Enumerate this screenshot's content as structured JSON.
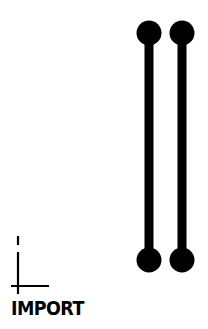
{
  "import_button": {
    "label": "IMPORT",
    "icon": "axis-corner-icon"
  },
  "graphic": {
    "description": "two vertical bars with round ends",
    "color": "#000000",
    "bars": [
      {
        "cx": 149,
        "top_cy": 33,
        "bottom_cy": 260,
        "radius": 12.5,
        "width": 9
      },
      {
        "cx": 182,
        "top_cy": 33,
        "bottom_cy": 260,
        "radius": 12.5,
        "width": 9
      }
    ]
  },
  "colors": {
    "background": "#ffffff",
    "foreground": "#000000"
  }
}
